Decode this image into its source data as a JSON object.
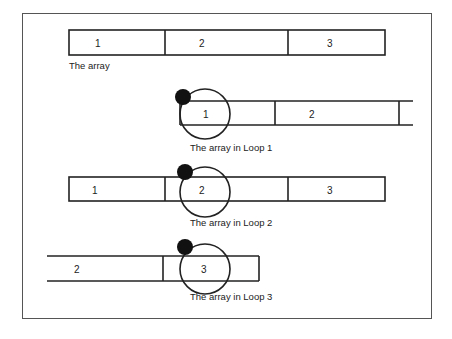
{
  "diagram": {
    "top_array": {
      "cells": [
        "1",
        "2",
        "3"
      ],
      "caption": "The array"
    },
    "loops": [
      {
        "name": "loop-1",
        "visible_cells": [
          "1",
          "2"
        ],
        "highlighted_cell": "1",
        "caption": "The array in Loop 1"
      },
      {
        "name": "loop-2",
        "visible_cells": [
          "1",
          "2",
          "3"
        ],
        "highlighted_cell": "2",
        "caption": "The array in Loop 2"
      },
      {
        "name": "loop-3",
        "visible_cells": [
          "2",
          "3"
        ],
        "highlighted_cell": "3",
        "caption": "The array in Loop 3"
      }
    ],
    "colors": {
      "stroke": "#222222",
      "dot": "#111111",
      "frame": "#555555"
    }
  }
}
